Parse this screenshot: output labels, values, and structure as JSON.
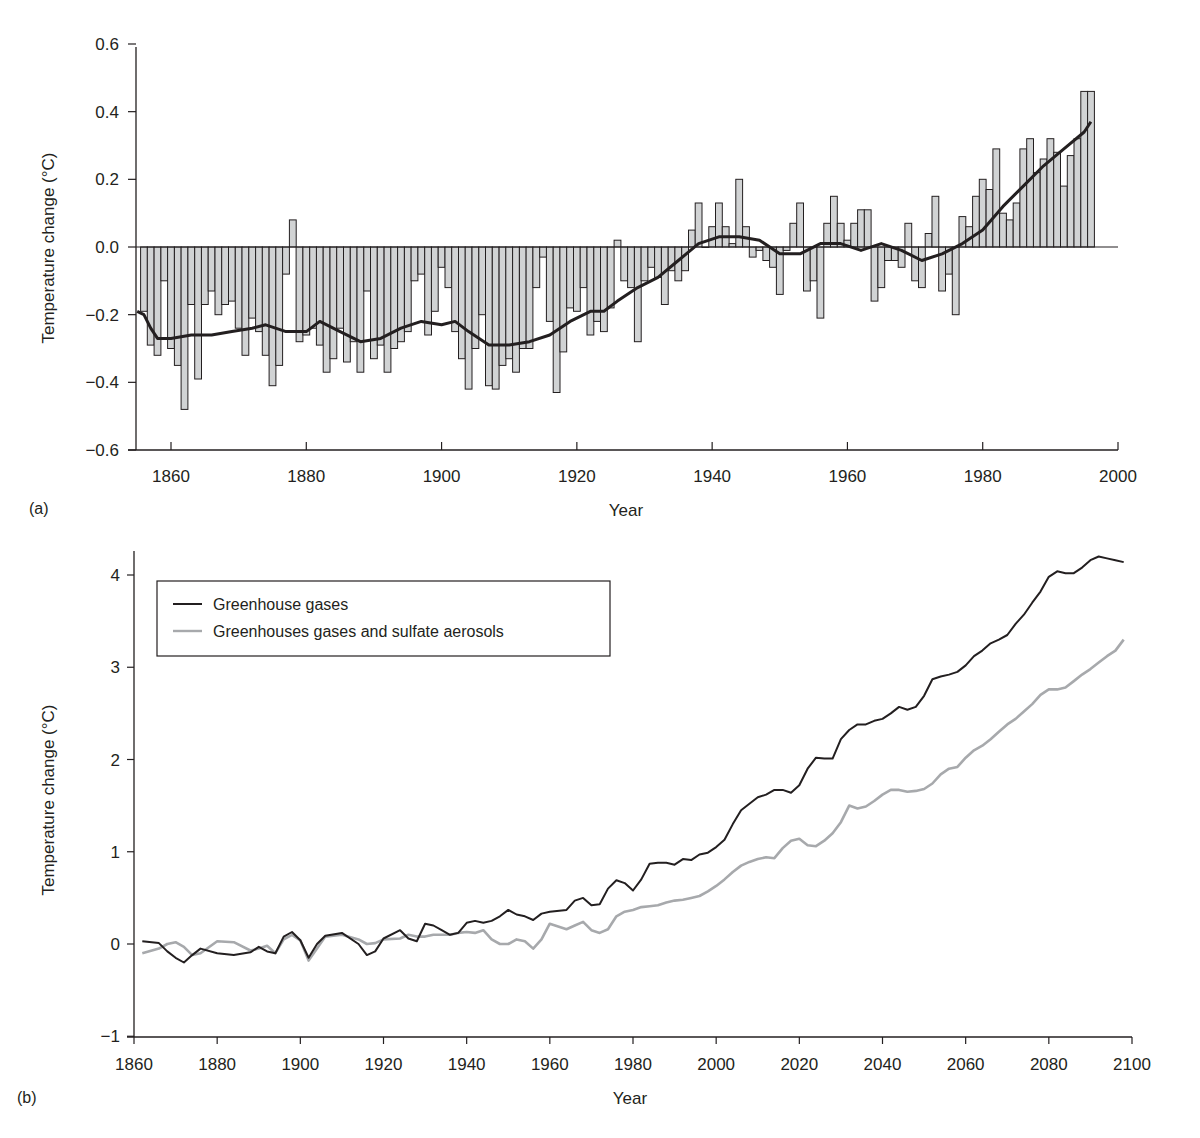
{
  "chart_data": [
    {
      "panel": "(a)",
      "type": "bar",
      "title": "",
      "xlabel": "Year",
      "ylabel": "Temperature change (°C)",
      "xlim": [
        1855,
        2000
      ],
      "ylim": [
        -0.6,
        0.6
      ],
      "xticks": [
        1860,
        1880,
        1900,
        1920,
        1940,
        1960,
        1980,
        2000
      ],
      "yticks": [
        0.6,
        0.4,
        0.2,
        0.0,
        -0.2,
        -0.4,
        -0.6
      ],
      "ytick_labels": [
        "0.6",
        "0.4",
        "0.2",
        "0.0",
        "−0.2",
        "−0.4",
        "−0.6"
      ],
      "grid": false,
      "bar_color": "#d1d3d4",
      "bar_edge_color": "#231f20",
      "x": [
        1856,
        1857,
        1858,
        1859,
        1860,
        1861,
        1862,
        1863,
        1864,
        1865,
        1866,
        1867,
        1868,
        1869,
        1870,
        1871,
        1872,
        1873,
        1874,
        1875,
        1876,
        1877,
        1878,
        1879,
        1880,
        1881,
        1882,
        1883,
        1884,
        1885,
        1886,
        1887,
        1888,
        1889,
        1890,
        1891,
        1892,
        1893,
        1894,
        1895,
        1896,
        1897,
        1898,
        1899,
        1900,
        1901,
        1902,
        1903,
        1904,
        1905,
        1906,
        1907,
        1908,
        1909,
        1910,
        1911,
        1912,
        1913,
        1914,
        1915,
        1916,
        1917,
        1918,
        1919,
        1920,
        1921,
        1922,
        1923,
        1924,
        1925,
        1926,
        1927,
        1928,
        1929,
        1930,
        1931,
        1932,
        1933,
        1934,
        1935,
        1936,
        1937,
        1938,
        1939,
        1940,
        1941,
        1942,
        1943,
        1944,
        1945,
        1946,
        1947,
        1948,
        1949,
        1950,
        1951,
        1952,
        1953,
        1954,
        1955,
        1956,
        1957,
        1958,
        1959,
        1960,
        1961,
        1962,
        1963,
        1964,
        1965,
        1966,
        1967,
        1968,
        1969,
        1970,
        1971,
        1972,
        1973,
        1974,
        1975,
        1976,
        1977,
        1978,
        1979,
        1980,
        1981,
        1982,
        1983,
        1984,
        1985,
        1986,
        1987,
        1988,
        1989,
        1990,
        1991,
        1992,
        1993,
        1994,
        1995,
        1996
      ],
      "values": [
        -0.19,
        -0.29,
        -0.32,
        -0.1,
        -0.3,
        -0.35,
        -0.48,
        -0.17,
        -0.39,
        -0.17,
        -0.13,
        -0.2,
        -0.17,
        -0.16,
        -0.24,
        -0.32,
        -0.21,
        -0.25,
        -0.32,
        -0.41,
        -0.35,
        -0.08,
        0.08,
        -0.28,
        -0.26,
        -0.24,
        -0.29,
        -0.37,
        -0.33,
        -0.24,
        -0.34,
        -0.28,
        -0.37,
        -0.13,
        -0.33,
        -0.29,
        -0.37,
        -0.3,
        -0.28,
        -0.25,
        -0.1,
        -0.08,
        -0.26,
        -0.19,
        -0.06,
        -0.12,
        -0.25,
        -0.33,
        -0.42,
        -0.3,
        -0.2,
        -0.41,
        -0.42,
        -0.35,
        -0.33,
        -0.37,
        -0.3,
        -0.3,
        -0.12,
        -0.03,
        -0.22,
        -0.43,
        -0.31,
        -0.18,
        -0.19,
        -0.12,
        -0.26,
        -0.22,
        -0.25,
        -0.18,
        0.02,
        -0.1,
        -0.12,
        -0.28,
        -0.1,
        -0.06,
        -0.09,
        -0.17,
        -0.07,
        -0.1,
        -0.07,
        0.05,
        0.13,
        0.0,
        0.06,
        0.13,
        0.06,
        0.01,
        0.2,
        0.06,
        -0.03,
        -0.01,
        -0.04,
        -0.06,
        -0.14,
        -0.01,
        0.07,
        0.13,
        -0.13,
        -0.1,
        -0.21,
        0.07,
        0.15,
        0.07,
        0.02,
        0.07,
        0.11,
        0.11,
        -0.16,
        -0.12,
        -0.04,
        -0.04,
        -0.06,
        0.07,
        -0.1,
        -0.12,
        0.04,
        0.15,
        -0.13,
        -0.08,
        -0.2,
        0.09,
        0.06,
        0.15,
        0.2,
        0.17,
        0.29,
        0.1,
        0.08,
        0.13,
        0.29,
        0.32,
        0.22,
        0.26,
        0.32,
        0.28,
        0.18,
        0.27,
        0.32,
        0.46,
        0.46
      ],
      "smoothed_line": {
        "color": "#231f20",
        "x": [
          1855,
          1856,
          1857,
          1858,
          1860,
          1863,
          1866,
          1869,
          1872,
          1874,
          1877,
          1880,
          1882,
          1885,
          1888,
          1891,
          1894,
          1897,
          1900,
          1902,
          1904,
          1907,
          1910,
          1913,
          1916,
          1919,
          1922,
          1924,
          1926,
          1929,
          1932,
          1935,
          1938,
          1941,
          1944,
          1947,
          1950,
          1953,
          1956,
          1959,
          1962,
          1965,
          1968,
          1971,
          1974,
          1977,
          1980,
          1983,
          1986,
          1989,
          1992,
          1995,
          1996
        ],
        "y": [
          -0.19,
          -0.2,
          -0.24,
          -0.27,
          -0.27,
          -0.26,
          -0.26,
          -0.25,
          -0.24,
          -0.23,
          -0.25,
          -0.25,
          -0.22,
          -0.25,
          -0.28,
          -0.27,
          -0.24,
          -0.22,
          -0.23,
          -0.22,
          -0.25,
          -0.29,
          -0.29,
          -0.28,
          -0.26,
          -0.22,
          -0.19,
          -0.19,
          -0.16,
          -0.12,
          -0.09,
          -0.04,
          0.01,
          0.03,
          0.03,
          0.02,
          -0.02,
          -0.02,
          0.01,
          0.01,
          -0.01,
          0.01,
          -0.01,
          -0.04,
          -0.02,
          0.01,
          0.05,
          0.12,
          0.18,
          0.24,
          0.29,
          0.34,
          0.37
        ]
      }
    },
    {
      "panel": "(b)",
      "type": "line",
      "title": "",
      "xlabel": "Year",
      "ylabel": "Temperature change (°C)",
      "xlim": [
        1860,
        2100
      ],
      "ylim": [
        -1,
        4.2
      ],
      "xticks": [
        1860,
        1880,
        1900,
        1920,
        1940,
        1960,
        1980,
        2000,
        2020,
        2040,
        2060,
        2080,
        2100
      ],
      "yticks": [
        4,
        3,
        2,
        1,
        0,
        -1
      ],
      "ytick_labels": [
        "4",
        "3",
        "2",
        "1",
        "0",
        "−1"
      ],
      "grid": false,
      "legend_position": "upper left (boxed)",
      "x": [
        1862,
        1866,
        1868,
        1870,
        1872,
        1874,
        1876,
        1880,
        1884,
        1888,
        1890,
        1892,
        1894,
        1896,
        1898,
        1900,
        1902,
        1904,
        1906,
        1910,
        1914,
        1916,
        1918,
        1920,
        1924,
        1926,
        1928,
        1930,
        1932,
        1934,
        1936,
        1938,
        1940,
        1942,
        1944,
        1946,
        1948,
        1950,
        1952,
        1954,
        1956,
        1958,
        1960,
        1964,
        1966,
        1968,
        1970,
        1972,
        1974,
        1976,
        1978,
        1980,
        1982,
        1984,
        1986,
        1988,
        1990,
        1992,
        1994,
        1996,
        1998,
        2000,
        2002,
        2004,
        2006,
        2008,
        2010,
        2012,
        2014,
        2016,
        2018,
        2020,
        2022,
        2024,
        2026,
        2028,
        2030,
        2032,
        2034,
        2036,
        2038,
        2040,
        2042,
        2044,
        2046,
        2048,
        2050,
        2052,
        2054,
        2056,
        2058,
        2060,
        2062,
        2064,
        2066,
        2068,
        2070,
        2072,
        2074,
        2076,
        2078,
        2080,
        2082,
        2084,
        2086,
        2088,
        2090,
        2092,
        2094,
        2096,
        2098
      ],
      "series": [
        {
          "name": "Greenhouse gases",
          "color": "#231f20",
          "values": [
            0.03,
            0.01,
            -0.08,
            -0.15,
            -0.2,
            -0.12,
            -0.05,
            -0.1,
            -0.12,
            -0.09,
            -0.03,
            -0.08,
            -0.1,
            0.08,
            0.13,
            0.04,
            -0.15,
            0.0,
            0.09,
            0.12,
            0.0,
            -0.12,
            -0.08,
            0.06,
            0.15,
            0.06,
            0.03,
            0.22,
            0.2,
            0.15,
            0.1,
            0.12,
            0.23,
            0.25,
            0.23,
            0.25,
            0.3,
            0.37,
            0.32,
            0.3,
            0.26,
            0.33,
            0.35,
            0.37,
            0.47,
            0.5,
            0.42,
            0.43,
            0.6,
            0.69,
            0.66,
            0.58,
            0.7,
            0.87,
            0.88,
            0.88,
            0.86,
            0.92,
            0.91,
            0.97,
            0.99,
            1.05,
            1.13,
            1.3,
            1.45,
            1.52,
            1.59,
            1.62,
            1.67,
            1.67,
            1.64,
            1.72,
            1.9,
            2.02,
            2.01,
            2.01,
            2.22,
            2.32,
            2.38,
            2.38,
            2.42,
            2.44,
            2.5,
            2.57,
            2.54,
            2.57,
            2.69,
            2.87,
            2.9,
            2.92,
            2.95,
            3.02,
            3.12,
            3.18,
            3.26,
            3.3,
            3.35,
            3.47,
            3.57,
            3.7,
            3.82,
            3.98,
            4.04,
            4.02,
            4.02,
            4.08,
            4.16,
            4.2,
            4.18,
            4.16,
            4.14
          ]
        },
        {
          "name": "Greenhouses gases and sulfate aerosols",
          "color": "#a7a9ac",
          "values": [
            -0.1,
            -0.05,
            0.0,
            0.02,
            -0.03,
            -0.12,
            -0.1,
            0.03,
            0.02,
            -0.07,
            -0.05,
            -0.02,
            -0.1,
            0.05,
            0.1,
            0.04,
            -0.18,
            -0.05,
            0.08,
            0.1,
            0.05,
            0.0,
            0.01,
            0.05,
            0.06,
            0.1,
            0.08,
            0.08,
            0.1,
            0.1,
            0.1,
            0.12,
            0.13,
            0.12,
            0.15,
            0.05,
            0.0,
            0.0,
            0.05,
            0.03,
            -0.05,
            0.05,
            0.22,
            0.16,
            0.2,
            0.24,
            0.15,
            0.12,
            0.16,
            0.3,
            0.35,
            0.37,
            0.4,
            0.41,
            0.42,
            0.45,
            0.47,
            0.48,
            0.5,
            0.52,
            0.57,
            0.63,
            0.7,
            0.78,
            0.85,
            0.89,
            0.92,
            0.94,
            0.93,
            1.04,
            1.12,
            1.14,
            1.07,
            1.06,
            1.12,
            1.2,
            1.32,
            1.5,
            1.47,
            1.49,
            1.55,
            1.62,
            1.67,
            1.67,
            1.65,
            1.66,
            1.68,
            1.74,
            1.84,
            1.9,
            1.92,
            2.02,
            2.1,
            2.15,
            2.22,
            2.3,
            2.38,
            2.44,
            2.52,
            2.6,
            2.7,
            2.76,
            2.76,
            2.78,
            2.85,
            2.92,
            2.98,
            3.05,
            3.12,
            3.18,
            3.3
          ]
        }
      ]
    }
  ],
  "panels": {
    "a": {
      "label": "(a)",
      "ylabel": "Temperature change (°C)",
      "xlabel": "Year",
      "yticks": [
        "0.6",
        "0.4",
        "0.2",
        "0.0",
        "−0.2",
        "−0.4",
        "−0.6"
      ],
      "xticks": [
        "1860",
        "1880",
        "1900",
        "1920",
        "1940",
        "1960",
        "1980",
        "2000"
      ]
    },
    "b": {
      "label": "(b)",
      "ylabel": "Temperature change (°C)",
      "xlabel": "Year",
      "yticks": [
        "4",
        "3",
        "2",
        "1",
        "0",
        "−1"
      ],
      "xticks": [
        "1860",
        "1880",
        "1900",
        "1920",
        "1940",
        "1960",
        "1980",
        "2000",
        "2020",
        "2040",
        "2060",
        "2080",
        "2100"
      ],
      "legend": [
        {
          "label": "Greenhouse gases",
          "color": "#231f20"
        },
        {
          "label": "Greenhouses gases and sulfate aerosols",
          "color": "#a7a9ac"
        }
      ]
    }
  }
}
